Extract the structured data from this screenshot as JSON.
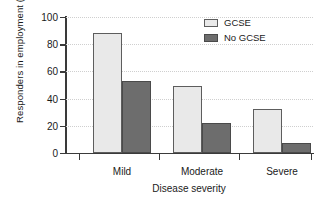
{
  "chart_data": {
    "type": "bar",
    "title": "",
    "subtitle": "",
    "xlabel": "Disease severity",
    "ylabel": "Responders in employment (%)",
    "categories": [
      "Mild",
      "Moderate",
      "Severe"
    ],
    "series": [
      {
        "name": "GCSE",
        "values": [
          88,
          49,
          32
        ],
        "color": "#e9e9e9"
      },
      {
        "name": "No GCSE",
        "values": [
          53,
          22,
          7
        ],
        "color": "#6d6d6d"
      }
    ],
    "ylim": [
      0,
      100
    ],
    "yticks": [
      0,
      20,
      40,
      60,
      80,
      100
    ],
    "ytick_labels": [
      "0",
      "20",
      "40",
      "60",
      "80",
      "100"
    ],
    "grid": true,
    "grid_style": "dotted-horizontal",
    "legend_position": "top-right",
    "legend_entries": [
      "GCSE",
      "No GCSE"
    ]
  },
  "axes": {
    "y_title": "Responders in employment (%)",
    "x_title": "Disease severity",
    "y_tick_0": "0",
    "y_tick_20": "20",
    "y_tick_40": "40",
    "y_tick_60": "60",
    "y_tick_80": "80",
    "y_tick_100": "100",
    "x_cat_0": "Mild",
    "x_cat_1": "Moderate",
    "x_cat_2": "Severe"
  },
  "legend": {
    "item_0_label": "GCSE",
    "item_1_label": "No GCSE"
  },
  "colors": {
    "light_bar": "#e9e9e9",
    "dark_bar": "#6d6d6d",
    "axis": "#3a3a3a",
    "grid": "#cfcfcf",
    "background": "#ffffff",
    "text": "#1a1a1a"
  }
}
